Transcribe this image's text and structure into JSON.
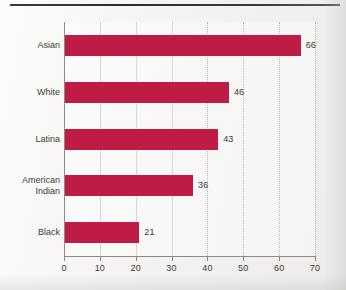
{
  "figure": {
    "background_color": "#f3f2f0",
    "rule_color": "#323234",
    "bar_color": "#be1b45",
    "axis_color": "#8b8a88",
    "grid_color": "#b9b8b6",
    "text_color": "#3b3b3d"
  },
  "chart_data": {
    "type": "bar",
    "orientation": "horizontal",
    "title": "",
    "subtitle": "",
    "xlabel": "",
    "ylabel": "",
    "categories": [
      "Asian",
      "White",
      "Latina",
      "American\nIndian",
      "Black"
    ],
    "values": [
      66,
      46,
      43,
      36,
      21
    ],
    "value_labels": [
      "66",
      "46",
      "43",
      "36",
      "21"
    ],
    "xlim": [
      0,
      70
    ],
    "xticks": [
      0,
      10,
      20,
      30,
      40,
      50,
      60,
      70
    ],
    "xtick_labels": [
      "0",
      "10",
      "20",
      "30",
      "40",
      "50",
      "60",
      "70"
    ],
    "grid": "vertical-dotted",
    "legend": "none",
    "series": [
      {
        "name": "",
        "values": [
          66,
          46,
          43,
          36,
          21
        ]
      }
    ]
  }
}
